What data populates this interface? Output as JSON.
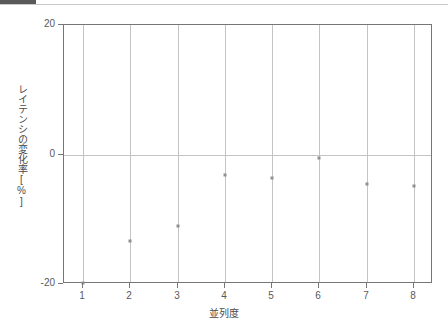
{
  "chart_data": {
    "type": "scatter",
    "title": "",
    "xlabel": "並列度",
    "ylabel": "レイテンシの変化率[%]",
    "x": [
      1,
      2,
      3,
      4,
      5,
      6,
      7,
      8
    ],
    "values": [
      -19.9,
      -13.3,
      -11.1,
      -3.1,
      -3.6,
      -0.6,
      -4.6,
      -4.8
    ],
    "series": [
      {
        "name": "レイテンシの変化率",
        "values": [
          -19.9,
          -13.3,
          -11.1,
          -3.1,
          -3.6,
          -0.6,
          -4.6,
          -4.8
        ]
      }
    ],
    "xlim": [
      0.6,
      8.4
    ],
    "ylim": [
      -20,
      20
    ],
    "xticks": [
      1,
      2,
      3,
      4,
      5,
      6,
      7,
      8
    ],
    "xtick_labels": [
      "1",
      "2",
      "3",
      "4",
      "5",
      "6",
      "7",
      "8"
    ],
    "yticks": [
      -20,
      0,
      20
    ],
    "ytick_labels": [
      "-20",
      "0",
      "20"
    ],
    "grid": "vertical-only",
    "zero_line": 0,
    "legend": null,
    "marker_color": "#8f8f8f",
    "grid_color": "#c4c4c4",
    "axis_color": "#767676"
  },
  "axes": {
    "y_title": "レイテンシの変化率[%]",
    "x_title": "並列度",
    "y_labels": [
      "20",
      "0",
      "-20"
    ],
    "x_labels": [
      "1",
      "2",
      "3",
      "4",
      "5",
      "6",
      "7",
      "8"
    ]
  },
  "colors": {
    "marker": "#8f8f8f",
    "grid": "#c4c4c4",
    "frame": "#767676",
    "text": "#4a4a4a",
    "strip_block": "#5a5a5a",
    "strip_rule": "#c9c9c9",
    "background": "#ffffff"
  }
}
